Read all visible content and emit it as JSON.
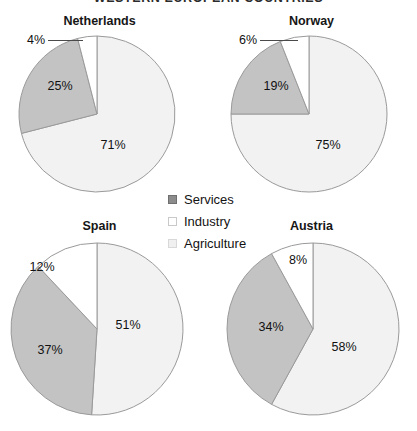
{
  "figure": {
    "title": "WESTERN EUROPEAN COUNTRIES"
  },
  "legend": {
    "position": "center",
    "items": [
      {
        "label": "Services",
        "color": "#8c8c8c",
        "border": "#6f6f6f",
        "icon": "legend-swatch-services"
      },
      {
        "label": "Industry",
        "color": "#ffffff",
        "border": "#c9c9c9",
        "icon": "legend-swatch-industry"
      },
      {
        "label": "Agriculture",
        "color": "#f0f0f0",
        "border": "#d8d8d8",
        "icon": "legend-swatch-agriculture"
      }
    ]
  },
  "palette": {
    "services": "#c3c3c3",
    "industry": "#ffffff",
    "agriculture": "#f2f2f2",
    "slice_border": "#9a9a9a",
    "label_text": "#111111",
    "leader_line": "#4a4a4a"
  },
  "chart_data": [
    {
      "type": "pie",
      "title": "Netherlands",
      "labels": [
        "Agriculture",
        "Services",
        "Industry"
      ],
      "values": [
        71,
        25,
        4
      ],
      "value_labels": [
        "71%",
        "25%",
        "4%"
      ],
      "colors": [
        "#f2f2f2",
        "#c3c3c3",
        "#ffffff"
      ],
      "total": 100,
      "units": "percent",
      "legend": "shared"
    },
    {
      "type": "pie",
      "title": "Norway",
      "labels": [
        "Agriculture",
        "Services",
        "Industry"
      ],
      "values": [
        75,
        19,
        6
      ],
      "value_labels": [
        "75%",
        "19%",
        "6%"
      ],
      "colors": [
        "#f2f2f2",
        "#c3c3c3",
        "#ffffff"
      ],
      "total": 100,
      "units": "percent",
      "legend": "shared"
    },
    {
      "type": "pie",
      "title": "Spain",
      "labels": [
        "Agriculture",
        "Services",
        "Industry"
      ],
      "values": [
        51,
        37,
        12
      ],
      "value_labels": [
        "51%",
        "37%",
        "12%"
      ],
      "colors": [
        "#f2f2f2",
        "#c3c3c3",
        "#ffffff"
      ],
      "total": 100,
      "units": "percent",
      "legend": "shared"
    },
    {
      "type": "pie",
      "title": "Austria",
      "labels": [
        "Agriculture",
        "Services",
        "Industry"
      ],
      "values": [
        58,
        34,
        8
      ],
      "value_labels": [
        "58%",
        "34%",
        "8%"
      ],
      "colors": [
        "#f2f2f2",
        "#c3c3c3",
        "#ffffff"
      ],
      "total": 100,
      "units": "percent",
      "legend": "shared"
    }
  ]
}
